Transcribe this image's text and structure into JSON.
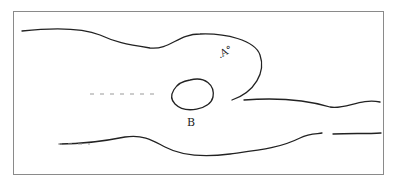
{
  "figure": {
    "labels": {
      "obstacle": "B",
      "region": ".A°"
    },
    "colors": {
      "ink": "#222222",
      "frame": "#8a8a8a",
      "background": "#ffffff"
    }
  }
}
